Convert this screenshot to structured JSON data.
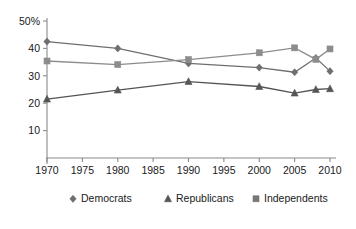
{
  "chart_data": {
    "type": "line",
    "title": "",
    "xlabel": "",
    "ylabel": "",
    "xlim": [
      1970,
      2010
    ],
    "ylim": [
      0,
      50
    ],
    "grid": false,
    "legend_position": "bottom",
    "y_ticks": [
      10,
      20,
      30,
      40,
      50
    ],
    "y_tick_labels": [
      "10",
      "20",
      "30",
      "40",
      "50%"
    ],
    "x_ticks": [
      1970,
      1975,
      1980,
      1985,
      1990,
      1995,
      2000,
      2005,
      2010
    ],
    "x_tick_labels": [
      "1970",
      "1975",
      "1980",
      "1985",
      "1990",
      "1995",
      "2000",
      "2005",
      "2010"
    ],
    "series": [
      {
        "name": "Democrats",
        "marker": "diamond",
        "color": "#6e6e6e",
        "x": [
          1970,
          1980,
          1990,
          2000,
          2005,
          2008,
          2010
        ],
        "values": [
          42.5,
          40.0,
          34.5,
          33.0,
          31.3,
          36.5,
          31.7
        ]
      },
      {
        "name": "Republicans",
        "marker": "triangle",
        "color": "#555555",
        "x": [
          1970,
          1980,
          1990,
          2000,
          2005,
          2008,
          2010
        ],
        "values": [
          21.5,
          24.8,
          27.9,
          26.1,
          23.7,
          25.0,
          25.3
        ]
      },
      {
        "name": "Independents",
        "marker": "square",
        "color": "#8c8c8c",
        "x": [
          1970,
          1980,
          1990,
          2000,
          2005,
          2008,
          2010
        ],
        "values": [
          35.4,
          34.1,
          35.9,
          38.4,
          40.2,
          36.0,
          39.8
        ]
      }
    ],
    "legend": [
      {
        "label": "Democrats",
        "marker": "diamond",
        "color": "#6e6e6e"
      },
      {
        "label": "Republicans",
        "marker": "triangle",
        "color": "#555555"
      },
      {
        "label": "Independents",
        "marker": "square",
        "color": "#777777"
      }
    ]
  }
}
